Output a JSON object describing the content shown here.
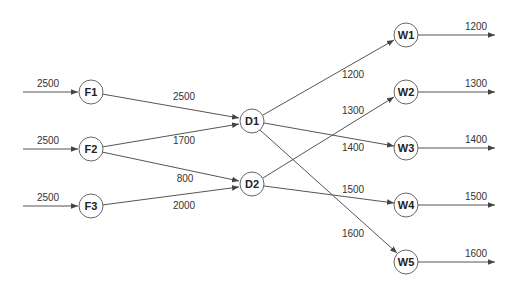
{
  "diagram": {
    "title": "",
    "colors": {
      "edge": "#555555",
      "node_stroke": "#666666",
      "text": "#222222"
    },
    "nodes": [
      {
        "id": "F1",
        "label": "F1",
        "x": 91,
        "y": 92
      },
      {
        "id": "F2",
        "label": "F2",
        "x": 91,
        "y": 149
      },
      {
        "id": "F3",
        "label": "F3",
        "x": 91,
        "y": 206
      },
      {
        "id": "D1",
        "label": "D1",
        "x": 252,
        "y": 121
      },
      {
        "id": "D2",
        "label": "D2",
        "x": 252,
        "y": 184
      },
      {
        "id": "W1",
        "label": "W1",
        "x": 406,
        "y": 35
      },
      {
        "id": "W2",
        "label": "W2",
        "x": 406,
        "y": 92
      },
      {
        "id": "W3",
        "label": "W3",
        "x": 406,
        "y": 148
      },
      {
        "id": "W4",
        "label": "W4",
        "x": 406,
        "y": 205
      },
      {
        "id": "W5",
        "label": "W5",
        "x": 406,
        "y": 262
      }
    ],
    "supplies": [
      {
        "to": "F1",
        "label": "2500"
      },
      {
        "to": "F2",
        "label": "2500"
      },
      {
        "to": "F3",
        "label": "2500"
      }
    ],
    "edges": [
      {
        "from": "F1",
        "to": "D1",
        "label": "2500"
      },
      {
        "from": "F2",
        "to": "D1",
        "label": "1700"
      },
      {
        "from": "F2",
        "to": "D2",
        "label": "800"
      },
      {
        "from": "F3",
        "to": "D2",
        "label": "2000"
      },
      {
        "from": "D1",
        "to": "W1",
        "label": "1200"
      },
      {
        "from": "D2",
        "to": "W2",
        "label": "1300"
      },
      {
        "from": "D1",
        "to": "W3",
        "label": "1400"
      },
      {
        "from": "D2",
        "to": "W4",
        "label": "1500"
      },
      {
        "from": "D1",
        "to": "W5",
        "label": "1600"
      }
    ],
    "demands": [
      {
        "from": "W1",
        "label": "1200"
      },
      {
        "from": "W2",
        "label": "1300"
      },
      {
        "from": "W3",
        "label": "1400"
      },
      {
        "from": "W4",
        "label": "1500"
      },
      {
        "from": "W5",
        "label": "1600"
      }
    ]
  }
}
